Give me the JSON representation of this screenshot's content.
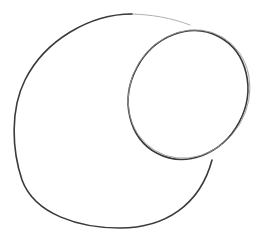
{
  "drawing": {
    "description": "Pencil sketch of a large open curved shape with a smaller tilted ellipse overlapping at the upper right",
    "background_color": "#ffffff",
    "stroke_color": "#3a3a3a",
    "faint_stroke_color": "#9a9a9a",
    "shapes": [
      {
        "name": "outer-curve",
        "type": "open-curve"
      },
      {
        "name": "inner-ellipse",
        "type": "ellipse"
      }
    ]
  }
}
